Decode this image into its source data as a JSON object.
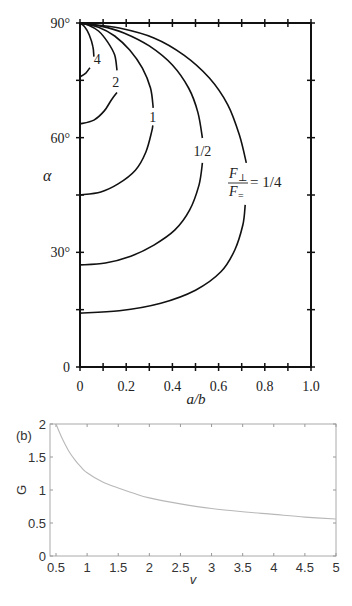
{
  "chart_data": [
    {
      "type": "line",
      "title": "",
      "xlabel": "a/b",
      "ylabel": "α",
      "xlim": [
        0,
        1.0
      ],
      "ylim": [
        0,
        90
      ],
      "xticks": [
        "0",
        "0.2",
        "0.4",
        "0.6",
        "0.8",
        "1.0"
      ],
      "xtick_values": [
        0,
        0.2,
        0.4,
        0.6,
        0.8,
        1.0
      ],
      "xminor_step": 0.1,
      "yticks": [
        "0",
        "30°",
        "60°",
        "90°"
      ],
      "ytick_values": [
        0,
        30,
        60,
        90
      ],
      "yminor_step": 15,
      "grid": false,
      "legend": "inline curve labels",
      "annotation": "F⊥/F= = 1/4",
      "series": [
        {
          "name": "4",
          "label_pos": [
            0.075,
            80.5
          ],
          "segments": [
            [
              [
                0,
                75.9
              ],
              [
                0.025,
                76.9
              ],
              [
                0.043,
                78.3
              ]
            ],
            [
              [
                0.06,
                81.2
              ],
              [
                0.056,
                83.8
              ],
              [
                0.04,
                86.9
              ],
              [
                0.02,
                89.0
              ],
              [
                0,
                90
              ]
            ]
          ]
        },
        {
          "name": "2",
          "label_pos": [
            0.155,
            74.6
          ],
          "segments": [
            [
              [
                0,
                63.6
              ],
              [
                0.06,
                64.6
              ],
              [
                0.105,
                67.0
              ],
              [
                0.135,
                69.8
              ],
              [
                0.16,
                71.8
              ]
            ],
            [
              [
                0.16,
                77.6
              ],
              [
                0.15,
                81.6
              ],
              [
                0.12,
                85.0
              ],
              [
                0.08,
                87.9
              ],
              [
                0.035,
                89.5
              ],
              [
                0,
                90
              ]
            ]
          ]
        },
        {
          "name": "1",
          "label_pos": [
            0.315,
            65.3
          ],
          "segments": [
            [
              [
                0,
                45.0
              ],
              [
                0.09,
                45.8
              ],
              [
                0.165,
                47.9
              ],
              [
                0.24,
                51.5
              ],
              [
                0.285,
                56.2
              ],
              [
                0.31,
                61.5
              ],
              [
                0.315,
                63.2
              ]
            ],
            [
              [
                0.317,
                67.8
              ],
              [
                0.305,
                73.0
              ],
              [
                0.27,
                78.2
              ],
              [
                0.215,
                82.9
              ],
              [
                0.15,
                86.6
              ],
              [
                0.08,
                88.9
              ],
              [
                0,
                90
              ]
            ]
          ]
        },
        {
          "name": "1/2",
          "label_pos": [
            0.53,
            56.6
          ],
          "segments": [
            [
              [
                0,
                26.7
              ],
              [
                0.11,
                27.2
              ],
              [
                0.22,
                29.0
              ],
              [
                0.32,
                31.9
              ],
              [
                0.41,
                35.8
              ],
              [
                0.475,
                41.1
              ],
              [
                0.515,
                47.6
              ],
              [
                0.53,
                53.4
              ]
            ],
            [
              [
                0.53,
                59.9
              ],
              [
                0.51,
                66.7
              ],
              [
                0.47,
                73.0
              ],
              [
                0.4,
                79.0
              ],
              [
                0.3,
                84.0
              ],
              [
                0.19,
                87.4
              ],
              [
                0.09,
                89.2
              ],
              [
                0,
                90
              ]
            ]
          ]
        },
        {
          "name": "1/4",
          "label_pos": [
            0.78,
            47.5
          ],
          "segments": [
            [
              [
                0,
                14.1
              ],
              [
                0.17,
                14.7
              ],
              [
                0.35,
                16.7
              ],
              [
                0.5,
                20.1
              ],
              [
                0.61,
                24.9
              ],
              [
                0.67,
                30.6
              ],
              [
                0.705,
                37.2
              ],
              [
                0.715,
                42.4
              ]
            ],
            [
              [
                0.72,
                53.4
              ],
              [
                0.69,
                60.7
              ],
              [
                0.64,
                68.6
              ],
              [
                0.56,
                75.6
              ],
              [
                0.45,
                81.6
              ],
              [
                0.32,
                86.1
              ],
              [
                0.17,
                88.7
              ],
              [
                0.04,
                89.7
              ],
              [
                0,
                90
              ]
            ]
          ]
        }
      ]
    },
    {
      "type": "line",
      "panel_label": "(b)",
      "title": "",
      "xlabel": "v",
      "ylabel": "G",
      "xlim": [
        0.4,
        5
      ],
      "ylim": [
        0,
        2
      ],
      "xticks": [
        "0.5",
        "1",
        "1.5",
        "2",
        "2.5",
        "3",
        "3.5",
        "4",
        "4.5",
        "5"
      ],
      "xtick_values": [
        0.5,
        1,
        1.5,
        2,
        2.5,
        3,
        3.5,
        4,
        4.5,
        5
      ],
      "yticks": [
        "0",
        "0.5",
        "1",
        "1.5",
        "2"
      ],
      "ytick_values": [
        0,
        0.5,
        1,
        1.5,
        2
      ],
      "grid": false,
      "line_color": "#b8b8b8",
      "series": [
        {
          "name": "G(v)",
          "x": [
            0.5,
            0.6,
            0.7,
            0.8,
            0.9,
            1.0,
            1.25,
            1.5,
            1.75,
            2.0,
            2.5,
            3.0,
            3.5,
            4.0,
            4.5,
            5.0
          ],
          "values": [
            2.0,
            1.78,
            1.6,
            1.46,
            1.35,
            1.26,
            1.12,
            1.03,
            0.95,
            0.88,
            0.79,
            0.72,
            0.67,
            0.63,
            0.59,
            0.56
          ]
        }
      ]
    }
  ],
  "top_panel": {
    "xlabel": "a/b",
    "ylabel": "α",
    "annotation_numerator": "F",
    "annotation_num_sub": "⊥",
    "annotation_denominator": "F",
    "annotation_den_sub": "=",
    "annotation_value": "= 1/4"
  },
  "bottom_panel": {
    "panel_label": "(b)",
    "xlabel": "v",
    "ylabel": "G"
  }
}
